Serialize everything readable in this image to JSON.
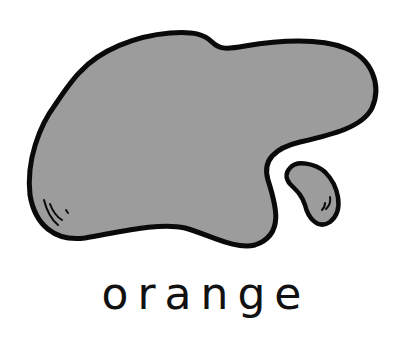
{
  "illustration": {
    "description": "gray amoeba-like blob with a small detached blob",
    "fill_color": "#9c9c9c",
    "stroke_color": "#0a0a0a"
  },
  "caption": {
    "text": "orange"
  }
}
